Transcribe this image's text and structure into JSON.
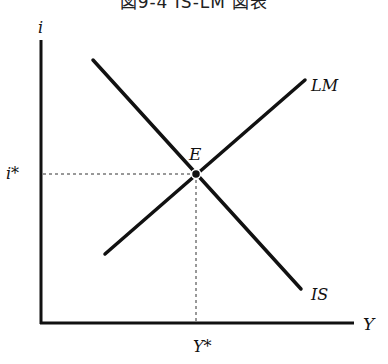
{
  "title": "図9-4 IS-LM 図表",
  "axes": {
    "y_label": "i",
    "x_label": "Y",
    "y_eq_label": "i*",
    "x_eq_label": "Y*"
  },
  "curves": {
    "is_label": "IS",
    "lm_label": "LM"
  },
  "equilibrium": {
    "label": "E"
  },
  "colors": {
    "line": "#111111",
    "guide": "#333333"
  }
}
